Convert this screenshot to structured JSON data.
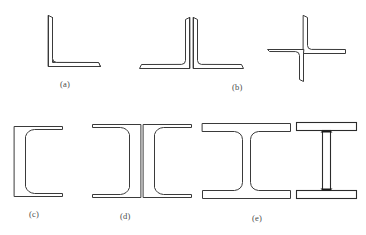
{
  "figure": {
    "background_color": "#ffffff",
    "outline_color": "#3a3a3a",
    "width": 366,
    "height": 235
  },
  "captions": [
    {
      "key": "a",
      "label": "(a)",
      "x": 60,
      "y": 79,
      "describes": "single rolled angle section"
    },
    {
      "key": "b",
      "label": "(b)",
      "x": 232,
      "y": 82,
      "describes": "double angle tee and cruciform built-up sections"
    },
    {
      "key": "c",
      "label": "(c)",
      "x": 29,
      "y": 209,
      "describes": "single rolled channel section"
    },
    {
      "key": "d",
      "label": "(d)",
      "x": 120,
      "y": 211,
      "describes": "double channel back-to-back section"
    },
    {
      "key": "e",
      "label": "(e)",
      "x": 252,
      "y": 213,
      "describes": "rolled wide flange beam and built-up welded plate girder"
    }
  ],
  "shapes": [
    {
      "id": "angle-single",
      "name": "single-angle-section",
      "group": "a"
    },
    {
      "id": "double-angle-tee",
      "name": "double-angle-tee-section",
      "group": "b"
    },
    {
      "id": "cruciform-angles",
      "name": "cruciform-angle-section",
      "group": "b"
    },
    {
      "id": "channel-single",
      "name": "single-channel-section",
      "group": "c"
    },
    {
      "id": "double-channel",
      "name": "double-channel-section",
      "group": "d"
    },
    {
      "id": "wide-flange",
      "name": "wide-flange-i-section",
      "group": "e"
    },
    {
      "id": "plate-girder",
      "name": "built-up-plate-girder",
      "group": "e"
    }
  ]
}
